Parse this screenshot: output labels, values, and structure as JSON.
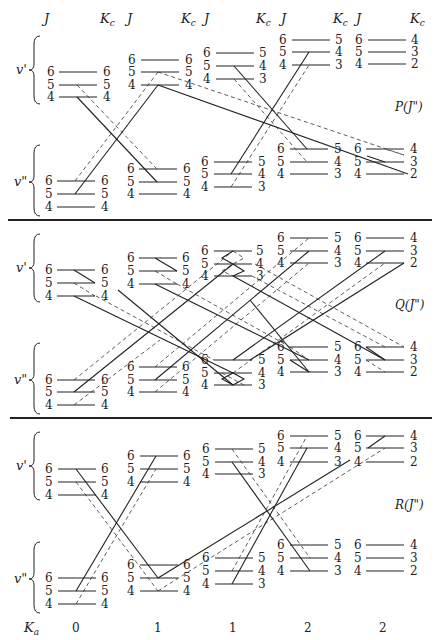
{
  "headers": {
    "columns": [
      {
        "j": "J",
        "kc": "K",
        "kc_sub": "c"
      },
      {
        "j": "J",
        "kc": "K",
        "kc_sub": "c"
      },
      {
        "j": "J",
        "kc": "K",
        "kc_sub": "c"
      },
      {
        "j": "J",
        "kc": "K",
        "kc_sub": "c"
      },
      {
        "j": "J",
        "kc": "K",
        "kc_sub": "c"
      }
    ]
  },
  "state_labels": {
    "upper": "v'",
    "lower": "v\""
  },
  "panels": [
    {
      "id": "P",
      "label": "P(J\")"
    },
    {
      "id": "Q",
      "label": "Q(J\")"
    },
    {
      "id": "R",
      "label": "R(J\")"
    }
  ],
  "columns": [
    {
      "ka": "0",
      "levels": [
        {
          "j": "6",
          "kc": "6"
        },
        {
          "j": "5",
          "kc": "5"
        },
        {
          "j": "4",
          "kc": "4"
        }
      ]
    },
    {
      "ka": "1",
      "levels": [
        {
          "j": "6",
          "kc": "6"
        },
        {
          "j": "5",
          "kc": "5"
        },
        {
          "j": "4",
          "kc": "4"
        }
      ]
    },
    {
      "ka": "1",
      "levels": [
        {
          "j": "6",
          "kc": "5"
        },
        {
          "j": "5",
          "kc": "4"
        },
        {
          "j": "4",
          "kc": "3"
        }
      ]
    },
    {
      "ka": "2",
      "levels": [
        {
          "j": "6",
          "kc": "5"
        },
        {
          "j": "5",
          "kc": "4"
        },
        {
          "j": "4",
          "kc": "3"
        }
      ]
    },
    {
      "ka": "2",
      "levels": [
        {
          "j": "6",
          "kc": "4"
        },
        {
          "j": "5",
          "kc": "3"
        },
        {
          "j": "4",
          "kc": "2"
        }
      ]
    }
  ],
  "footer": {
    "ka_label": "K",
    "ka_sub": "a"
  }
}
